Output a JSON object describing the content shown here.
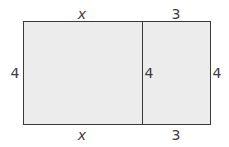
{
  "diagram": {
    "type": "area-model",
    "colors": {
      "fill": "#ececec",
      "stroke": "#3a3a3a",
      "text": "#3d3d3d"
    },
    "regions": [
      {
        "name": "left-rectangle",
        "width": "x",
        "height": "4"
      },
      {
        "name": "right-rectangle",
        "width": "3",
        "height": "4"
      }
    ],
    "labels": {
      "top_left": "x",
      "top_right": "3",
      "left_side": "4",
      "middle_divider": "4",
      "right_side": "4",
      "bottom_left": "x",
      "bottom_right": "3"
    }
  }
}
